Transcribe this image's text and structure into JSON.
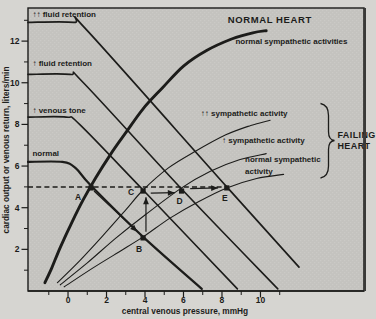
{
  "figure": {
    "kind": "scanned textbook physiology figure",
    "paper_color": "#d6d5d1",
    "plot_background_color": "#c4c3bf",
    "plot_texture_color": "#cbcac6",
    "ink_color": "#1c1c1a",
    "frame_right_color": "#3a3a38"
  },
  "chart_data": {
    "type": "line",
    "title": "",
    "xlabel": "central venous pressure, mmHg",
    "ylabel": "cardiac output  or venous return,  liters/min",
    "xlim": [
      -2.08,
      15.38
    ],
    "ylim": [
      0,
      13.59
    ],
    "grid": false,
    "x_ticks_major": [
      0,
      2,
      4,
      6,
      8,
      10
    ],
    "x_ticks_minor": [
      -1,
      1,
      3,
      5,
      7,
      9,
      11
    ],
    "y_ticks_major": [
      2,
      4,
      6,
      8,
      10,
      12
    ],
    "y_ticks_minor": [
      1,
      3,
      5,
      7,
      9,
      11,
      13
    ],
    "dashed_reference_line": {
      "y": 5.0,
      "x_start": -2.08,
      "x_end": 8.25
    },
    "series": [
      {
        "id": "co-normal-heart",
        "name": "normal heart cardiac output curve",
        "label": "normal sympathetic activities",
        "group": "NORMAL HEART",
        "width": 2.9,
        "points": [
          [
            -1.2,
            0.4
          ],
          [
            -0.85,
            1.1
          ],
          [
            -0.4,
            2.1
          ],
          [
            0.2,
            3.3
          ],
          [
            0.8,
            4.4
          ],
          [
            1.45,
            5.45
          ],
          [
            2.2,
            6.55
          ],
          [
            3.0,
            7.6
          ],
          [
            3.9,
            8.75
          ],
          [
            4.9,
            9.75
          ],
          [
            6.0,
            10.8
          ],
          [
            7.2,
            11.55
          ],
          [
            8.5,
            12.1
          ],
          [
            9.6,
            12.4
          ],
          [
            10.3,
            12.5
          ]
        ]
      },
      {
        "id": "vr-normal",
        "name": "venous return curve - normal",
        "label": "normal",
        "width": 2.2,
        "points": [
          [
            -2.08,
            6.2
          ],
          [
            -0.3,
            6.2
          ],
          [
            0.4,
            5.9
          ],
          [
            1.2,
            5.05
          ],
          [
            3.9,
            2.6
          ],
          [
            6.95,
            0.1
          ]
        ]
      },
      {
        "id": "vr-venous-tone",
        "name": "venous return curve - increased venous tone",
        "label": "↑ venous tone",
        "width": 1.6,
        "points": [
          [
            -2.08,
            8.35
          ],
          [
            -0.1,
            8.35
          ],
          [
            0.6,
            8.0
          ],
          [
            3.9,
            4.85
          ],
          [
            8.8,
            0.1
          ]
        ]
      },
      {
        "id": "vr-fluid-retention",
        "name": "venous return curve - increased fluid retention",
        "label": "↑ fluid retention",
        "width": 1.6,
        "points": [
          [
            -2.08,
            10.4
          ],
          [
            0.1,
            10.4
          ],
          [
            0.8,
            10.0
          ],
          [
            5.9,
            4.9
          ],
          [
            10.9,
            0.1
          ]
        ]
      },
      {
        "id": "vr-marked-fluid-retention",
        "name": "venous return curve - markedly increased fluid retention",
        "label": "↑↑ fluid retention",
        "width": 1.7,
        "points": [
          [
            -2.08,
            12.9
          ],
          [
            0.3,
            12.9
          ],
          [
            1.0,
            12.5
          ],
          [
            8.25,
            5.0
          ],
          [
            12.0,
            1.15
          ]
        ]
      },
      {
        "id": "co-failing-max-symp",
        "name": "failing heart - markedly increased sympathetic activity",
        "label": "↑↑ sympathetic activity",
        "group": "FAILING HEART",
        "width": 1.1,
        "points": [
          [
            -0.55,
            0.4
          ],
          [
            0.6,
            1.45
          ],
          [
            1.8,
            2.65
          ],
          [
            3.0,
            3.9
          ],
          [
            3.9,
            4.85
          ],
          [
            5.2,
            5.9
          ],
          [
            6.6,
            6.7
          ],
          [
            8.2,
            7.5
          ],
          [
            9.5,
            7.95
          ],
          [
            10.5,
            8.2
          ]
        ]
      },
      {
        "id": "co-failing-inc-symp",
        "name": "failing heart - increased sympathetic activity",
        "label": "↑ sympathetic activity",
        "group": "FAILING HEART",
        "width": 1.1,
        "points": [
          [
            -0.4,
            0.3
          ],
          [
            1.0,
            1.35
          ],
          [
            2.5,
            2.55
          ],
          [
            4.0,
            3.65
          ],
          [
            5.9,
            4.95
          ],
          [
            7.4,
            5.75
          ],
          [
            8.9,
            6.3
          ],
          [
            10.3,
            6.6
          ]
        ]
      },
      {
        "id": "co-failing-normal-symp",
        "name": "failing heart - normal sympathetic activity",
        "label": "normal sympathetic activity",
        "group": "FAILING HEART",
        "width": 1.1,
        "points": [
          [
            -0.2,
            0.2
          ],
          [
            1.2,
            1.05
          ],
          [
            2.6,
            1.85
          ],
          [
            3.9,
            2.6
          ],
          [
            5.3,
            3.5
          ],
          [
            6.8,
            4.3
          ],
          [
            8.25,
            4.95
          ],
          [
            9.8,
            5.4
          ],
          [
            11.2,
            5.6
          ]
        ]
      }
    ],
    "marked_points": [
      {
        "label": "A",
        "x": 1.2,
        "y": 4.95,
        "label_offset": [
          -13,
          12
        ]
      },
      {
        "label": "B",
        "x": 3.9,
        "y": 2.55,
        "label_offset": [
          -4,
          14
        ]
      },
      {
        "label": "C",
        "x": 3.9,
        "y": 4.8,
        "label_offset": [
          -12,
          4
        ]
      },
      {
        "label": "D",
        "x": 5.9,
        "y": 4.8,
        "label_offset": [
          -2,
          13
        ]
      },
      {
        "label": "E",
        "x": 8.25,
        "y": 4.95,
        "label_offset": [
          -2,
          13
        ]
      }
    ],
    "arrows": [
      {
        "name": "arrow-a-to-b",
        "from": [
          1.35,
          4.8
        ],
        "to": [
          3.6,
          2.85
        ]
      },
      {
        "name": "arrow-b-to-c",
        "from": [
          4.05,
          2.85
        ],
        "to": [
          4.05,
          4.5
        ]
      },
      {
        "name": "arrow-c-to-d",
        "from": [
          4.3,
          4.7
        ],
        "to": [
          5.55,
          4.72
        ]
      },
      {
        "name": "arrow-d-to-e",
        "from": [
          6.35,
          4.92
        ],
        "to": [
          7.8,
          4.95
        ]
      }
    ],
    "labels": [
      {
        "id": "label-marked-fluid-retention",
        "text": "↑↑ fluid retention",
        "x": -1.85,
        "y": 13.15,
        "size": 8,
        "weight": 700
      },
      {
        "id": "label-fluid-retention",
        "text": "↑ fluid retention",
        "x": -1.85,
        "y": 10.8,
        "size": 8,
        "weight": 700
      },
      {
        "id": "label-venous-tone",
        "text": "↑ venous tone",
        "x": -1.85,
        "y": 8.55,
        "size": 8,
        "weight": 700
      },
      {
        "id": "label-normal-vr",
        "text": "normal",
        "x": -1.85,
        "y": 6.5,
        "size": 8,
        "weight": 700
      },
      {
        "id": "label-normal-heart",
        "text": "NORMAL HEART",
        "x": 8.3,
        "y": 12.85,
        "size": 9.5,
        "weight": 700,
        "spacing": 0.6
      },
      {
        "id": "label-normal-symp-activities",
        "text": "normal sympathetic activities",
        "x": 8.7,
        "y": 11.85,
        "size": 8,
        "weight": 700
      },
      {
        "id": "label-max-symp",
        "text": "↑↑ sympathetic activity",
        "x": 6.9,
        "y": 8.4,
        "size": 8,
        "weight": 700
      },
      {
        "id": "label-inc-symp",
        "text": "↑ sympathetic activity",
        "x": 8.0,
        "y": 7.1,
        "size": 8,
        "weight": 700
      },
      {
        "id": "label-normal-symp-1",
        "text": "normal sympathetic",
        "x": 9.2,
        "y": 6.2,
        "size": 8,
        "weight": 700
      },
      {
        "id": "label-normal-symp-2",
        "text": "activity",
        "x": 9.2,
        "y": 5.6,
        "size": 8,
        "weight": 700
      },
      {
        "id": "label-failing-1",
        "text": "FAILING",
        "x": 14.0,
        "y": 7.35,
        "size": 9,
        "weight": 700,
        "spacing": 0.4
      },
      {
        "id": "label-failing-2",
        "text": "HEART",
        "x": 14.0,
        "y": 6.8,
        "size": 9,
        "weight": 700,
        "spacing": 0.4
      }
    ],
    "brace": {
      "x_outer": 320.5,
      "x_stem": 328.5,
      "x_tip": 334.5,
      "y_top": 103.5,
      "y_mid": 140.5,
      "y_bottom": 178
    },
    "legend_position": "none"
  }
}
